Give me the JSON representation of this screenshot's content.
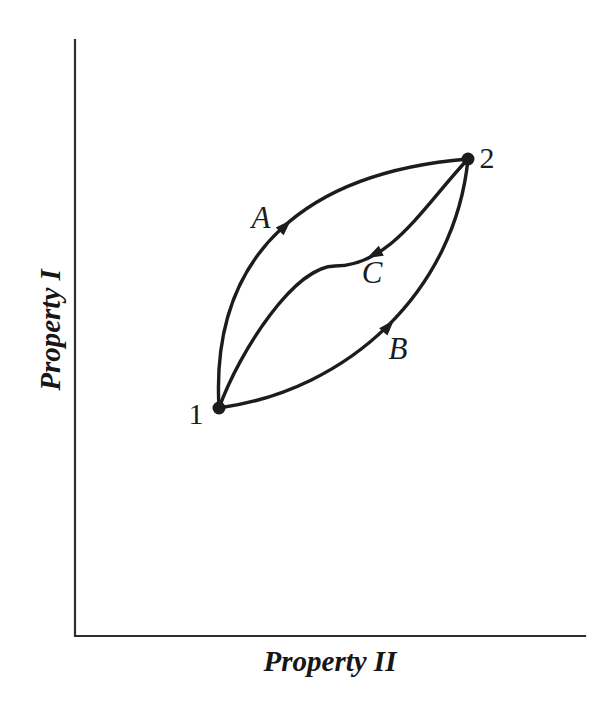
{
  "figure": {
    "background_color": "#ffffff",
    "ink_color": "#1c1c1c",
    "axis_color": "#2d2d2d",
    "axes": {
      "x_label": "Property II",
      "y_label": "Property I",
      "frame_path": "M75,40 L75,636 L585,636",
      "x_label_x": 330,
      "x_label_y": 671,
      "y_label_transform": "translate(60 330) rotate(-90)"
    },
    "states": [
      {
        "label": "1",
        "cx": 219,
        "cy": 408,
        "r": 6.5,
        "label_x": 196,
        "label_y": 424
      },
      {
        "label": "2",
        "cx": 468,
        "cy": 159,
        "r": 6.5,
        "label_x": 487,
        "label_y": 168
      }
    ],
    "processes": [
      {
        "label": "A",
        "from_state": "1",
        "to_state": "2",
        "path": "M219,408 C210,250 310,172 468,159",
        "label_x": 261,
        "label_y": 228,
        "arrow_transform": "translate(291 220) rotate(-45)"
      },
      {
        "label": "B",
        "from_state": "1",
        "to_state": "2",
        "path": "M219,408 C350,390 455,290 468,159",
        "label_x": 398,
        "label_y": 359,
        "arrow_transform": "translate(394 320) rotate(-48)"
      },
      {
        "label": "C",
        "from_state": "2",
        "to_state": "1",
        "path": "M468,159 C423,207 390,266 335,266 C295,266 240,350 219,408",
        "label_x": 372,
        "label_y": 283,
        "arrow_transform": "translate(367 258) rotate(153)"
      }
    ],
    "arrow_shape": "M0,0 L-16,5.5 L-16,-5.5 Z"
  }
}
